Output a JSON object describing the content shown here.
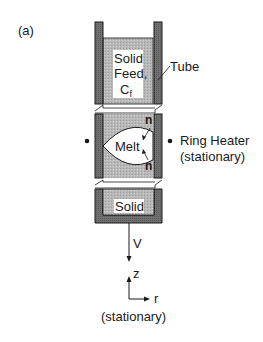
{
  "figure": {
    "panel_label": "(a)",
    "labels": {
      "solid_feed_line1": "Solid",
      "solid_feed_line2": "Feed,",
      "solid_feed_line3": "C",
      "solid_feed_subscript": "f",
      "tube": "Tube",
      "melt": "Melt",
      "normal_top": "n",
      "normal_bottom": "n",
      "ring_heater": "Ring Heater",
      "ring_heater_note": "(stationary)",
      "solid": "Solid",
      "velocity": "V",
      "axis_z": "z",
      "axis_r": "r",
      "axes_note": "(stationary)"
    },
    "colors": {
      "tube_wall": "#6e6e6e",
      "solid_fill": "#b4b4b4",
      "melt_fill": "#ffffff",
      "outline": "#1a1a1a"
    }
  }
}
